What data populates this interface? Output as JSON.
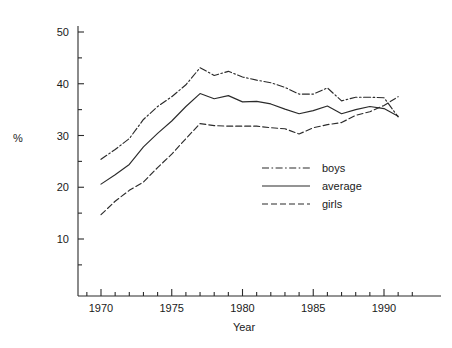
{
  "chart_data": {
    "type": "line",
    "title": "",
    "xlabel": "Year",
    "ylabel": "%",
    "xlim": [
      1968.5,
      1992.5
    ],
    "ylim": [
      0,
      53
    ],
    "grid": false,
    "legend_position": "center-right",
    "x_major_ticks": [
      1970,
      1975,
      1980,
      1985,
      1990
    ],
    "x_major_tick_labels": [
      "1970",
      "1975",
      "1980",
      "1985",
      "1990"
    ],
    "x_minor_tick_step": 1,
    "y_major_ticks": [
      10,
      20,
      30,
      40,
      50
    ],
    "y_major_tick_labels": [
      "10",
      "20",
      "30",
      "40",
      "50"
    ],
    "y_minor_ticks": [
      5,
      15,
      25,
      35,
      45
    ],
    "x": [
      1970,
      1971,
      1972,
      1973,
      1974,
      1975,
      1976,
      1977,
      1978,
      1979,
      1980,
      1981,
      1982,
      1983,
      1984,
      1985,
      1986,
      1987,
      1988,
      1989,
      1990,
      1991
    ],
    "series": [
      {
        "name": "boys",
        "style": "dash-dot",
        "color": "#2b2b2b",
        "x": [
          1970,
          1971,
          1972,
          1973,
          1974,
          1975,
          1976,
          1977,
          1978,
          1979,
          1980,
          1981,
          1982,
          1983,
          1984,
          1985,
          1986,
          1987,
          1988,
          1989,
          1990,
          1991
        ],
        "values": [
          25.4,
          27.3,
          29.4,
          33.1,
          35.6,
          37.5,
          39.8,
          43.1,
          41.6,
          42.4,
          41.3,
          40.7,
          40.2,
          39.3,
          38.0,
          38.0,
          39.2,
          36.7,
          37.4,
          37.4,
          37.3,
          33.6
        ]
      },
      {
        "name": "average",
        "style": "solid",
        "color": "#2b2b2b",
        "x": [
          1970,
          1971,
          1972,
          1973,
          1974,
          1975,
          1976,
          1977,
          1978,
          1979,
          1980,
          1981,
          1982,
          1983,
          1984,
          1985,
          1986,
          1987,
          1988,
          1989,
          1990,
          1991
        ],
        "values": [
          20.6,
          22.4,
          24.4,
          27.8,
          30.4,
          32.8,
          35.6,
          38.1,
          37.1,
          37.7,
          36.5,
          36.6,
          36.1,
          35.1,
          34.2,
          34.8,
          35.7,
          34.2,
          35.0,
          35.6,
          35.2,
          33.7
        ]
      },
      {
        "name": "girls",
        "style": "dashed",
        "color": "#2b2b2b",
        "x": [
          1970,
          1971,
          1972,
          1973,
          1974,
          1975,
          1976,
          1977,
          1978,
          1979,
          1980,
          1981,
          1982,
          1983,
          1984,
          1985,
          1986,
          1987,
          1988,
          1989,
          1990,
          1991
        ],
        "values": [
          14.7,
          17.3,
          19.4,
          21.0,
          23.8,
          26.4,
          29.4,
          32.3,
          31.9,
          31.8,
          31.8,
          31.8,
          31.5,
          31.3,
          30.3,
          31.5,
          32.1,
          32.5,
          33.9,
          34.6,
          35.8,
          37.5
        ]
      }
    ],
    "legend": [
      {
        "label": "boys",
        "style": "dash-dot"
      },
      {
        "label": "average",
        "style": "solid"
      },
      {
        "label": "girls",
        "style": "dashed"
      }
    ]
  }
}
